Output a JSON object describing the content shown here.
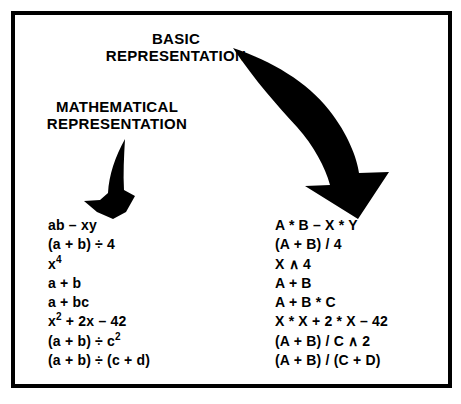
{
  "figure": {
    "background_color": "#ffffff",
    "frame_color": "#000000",
    "ink_color": "#000000"
  },
  "headings": {
    "basic": {
      "line1": "BASIC",
      "line2": "REPRESENTATION"
    },
    "mathematical": {
      "line1": "MATHEMATICAL",
      "line2": "REPRESENTATION"
    }
  },
  "arrows": {
    "small_arrow": {
      "name": "mathematical-representation-arrow",
      "direction": "down-left",
      "color": "#000000"
    },
    "large_arrow": {
      "name": "basic-representation-arrow",
      "direction": "curved-down-right",
      "color": "#000000"
    }
  },
  "columns": {
    "mathematical": {
      "label": "MATHEMATICAL REPRESENTATION",
      "expressions": [
        {
          "text": "ab – xy",
          "base": "ab – xy",
          "sup": ""
        },
        {
          "text": "(a + b) ÷ 4",
          "base": "(a + b) ÷ 4",
          "sup": ""
        },
        {
          "text": "x⁴",
          "base": "x",
          "sup": "4"
        },
        {
          "text": "a + b",
          "base": "a + b",
          "sup": ""
        },
        {
          "text": "a + bc",
          "base": "a + bc",
          "sup": ""
        },
        {
          "text": "x² + 2x – 42",
          "base": "x",
          "sup": "2",
          "tail": " + 2x – 42"
        },
        {
          "text": "(a + b) ÷ c²",
          "base": "(a + b) ÷ c",
          "sup": "2"
        },
        {
          "text": "(a + b) ÷ (c + d)",
          "base": "(a + b) ÷ (c + d)",
          "sup": ""
        }
      ]
    },
    "basic": {
      "label": "BASIC REPRESENTATION",
      "expressions": [
        {
          "text": "A * B – X * Y"
        },
        {
          "text": "(A + B) / 4"
        },
        {
          "text": "X ∧ 4"
        },
        {
          "text": "A + B"
        },
        {
          "text": "A + B * C"
        },
        {
          "text": "X * X + 2 * X – 42"
        },
        {
          "text": "(A + B) / C ∧ 2"
        },
        {
          "text": "(A + B) / (C + D)"
        }
      ]
    }
  }
}
